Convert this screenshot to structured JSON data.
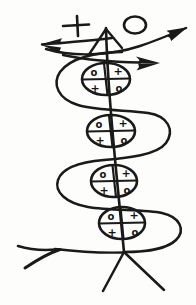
{
  "image": {
    "title": "Hand-drawn serpent and staff sigil",
    "kind": "ink-line-drawing",
    "width": 196,
    "height": 305,
    "background_color": "#fdfdfc",
    "ink_color": "#1a1a1a"
  },
  "top_marks": {
    "plus_sign": "+",
    "circle_glyph": "O"
  },
  "arrows": [
    {
      "name": "arrow-left",
      "direction": "left",
      "label": ""
    },
    {
      "name": "arrow-upper-right",
      "direction": "upper-right",
      "label": ""
    },
    {
      "name": "arrow-right",
      "direction": "right",
      "label": ""
    }
  ],
  "nodes": [
    {
      "name": "node-1",
      "index": 1,
      "cells": {
        "top_left": "o",
        "top_right": "+",
        "bottom_left": "+",
        "bottom_right": "o"
      }
    },
    {
      "name": "node-2",
      "index": 2,
      "cells": {
        "top_left": "o",
        "top_right": "+",
        "bottom_left": "+",
        "bottom_right": "o"
      }
    },
    {
      "name": "node-3",
      "index": 3,
      "cells": {
        "top_left": "o",
        "top_right": "+",
        "bottom_left": "+",
        "bottom_right": "o"
      }
    },
    {
      "name": "node-4",
      "index": 4,
      "cells": {
        "top_left": "o",
        "top_right": "+",
        "bottom_left": "+",
        "bottom_right": "o"
      }
    }
  ],
  "structure": {
    "staff_label": "",
    "serpent_label": "",
    "base_line_label": "",
    "legs_label": ""
  }
}
